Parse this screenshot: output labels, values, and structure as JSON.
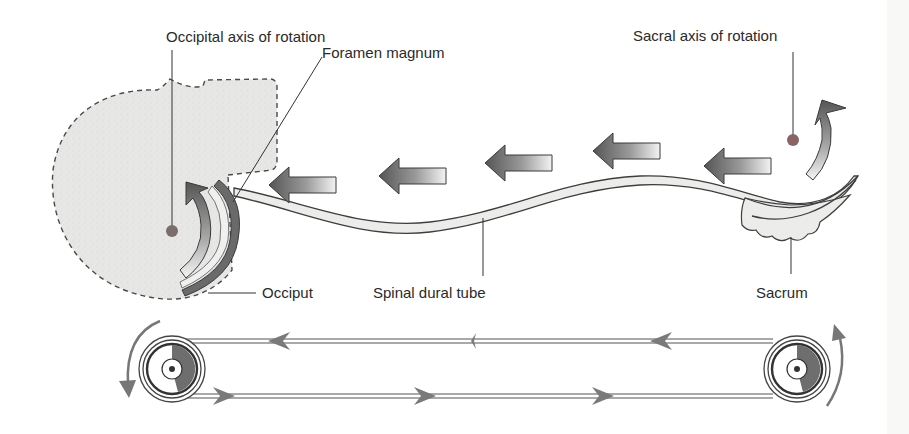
{
  "figure": {
    "type": "anatomical-diagram"
  },
  "labels": {
    "occipital_axis": "Occipital axis of rotation",
    "foramen_magnum": "Foramen magnum",
    "sacral_axis": "Sacral axis of rotation",
    "occiput": "Occiput",
    "spinal_dural_tube": "Spinal dural tube",
    "sacrum": "Sacrum"
  },
  "flow_arrows": {
    "count": 6,
    "direction": "left",
    "meaning": "movement along dural tube from sacrum toward occiput"
  },
  "rotation_arrows": {
    "occiput": "counter-clockwise (upward curve)",
    "sacrum": "upward curve"
  },
  "pulley_model": {
    "left_wheel_rotation": "counter-clockwise",
    "right_wheel_rotation": "counter-clockwise",
    "top_belt_direction": "left",
    "bottom_belt_direction": "right"
  },
  "colors": {
    "shade_fill": "#e6e6e4",
    "outline": "#444444",
    "arrow_dark": "#5a5a5a",
    "arrow_light": "#f2f2f2",
    "axis_dot": "#7a6a6a",
    "belt_arrow": "#7a7a7a"
  }
}
